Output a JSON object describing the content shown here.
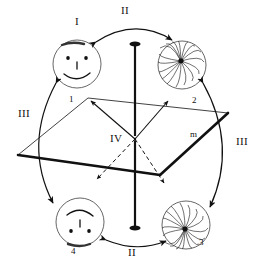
{
  "figure": {
    "background_color": "#ffffff",
    "ink_color": "#111111"
  },
  "labels": {
    "top_arc": "II",
    "bottom_arc": "II",
    "left_arc": "III",
    "right_arc": "III",
    "top_left_state": "I",
    "center": "IV",
    "plane": "m",
    "state_1": "1",
    "state_2": "2",
    "state_3": "3",
    "state_4": "4"
  },
  "states": [
    {
      "id": "1",
      "name": "smiley-face-upright",
      "marker": "1",
      "roman": "I",
      "position": "top-left",
      "pattern": "face"
    },
    {
      "id": "2",
      "name": "starburst-upright",
      "marker": "2",
      "roman": "",
      "position": "top-right",
      "pattern": "starburst"
    },
    {
      "id": "3",
      "name": "starburst-inverted",
      "marker": "3",
      "roman": "",
      "position": "bottom-right",
      "pattern": "starburst"
    },
    {
      "id": "4",
      "name": "smiley-face-inverted",
      "marker": "4",
      "roman": "",
      "position": "bottom-left",
      "pattern": "face-inverted"
    }
  ],
  "operations": [
    {
      "symbol": "I",
      "between": [
        "1",
        "1"
      ],
      "description": "identity state label"
    },
    {
      "symbol": "II",
      "between": [
        "1",
        "2"
      ],
      "description": "horizontal double arrow top"
    },
    {
      "symbol": "II",
      "between": [
        "4",
        "3"
      ],
      "description": "horizontal double arrow bottom"
    },
    {
      "symbol": "III",
      "between": [
        "1",
        "4"
      ],
      "description": "vertical double arrow left"
    },
    {
      "symbol": "III",
      "between": [
        "2",
        "3"
      ],
      "description": "vertical double arrow right"
    },
    {
      "symbol": "IV",
      "between": [
        "center"
      ],
      "description": "inversion centre with four rays"
    }
  ],
  "icons": {
    "axis": "vertical-axis-icon",
    "plane": "plane-parallelogram-icon",
    "arrow": "double-arrow-icon"
  }
}
